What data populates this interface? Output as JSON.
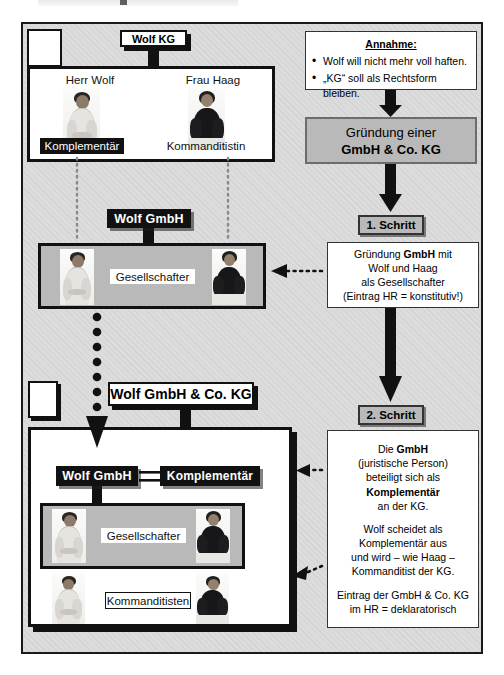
{
  "diagram": {
    "title": "Gründung einer GmbH & Co. KG",
    "corner_boxes": [
      "",
      ""
    ]
  },
  "left": {
    "kg_label": "Wolf KG",
    "person_man_name": "Herr Wolf",
    "person_woman_name": "Frau Haag",
    "man_role_initial": "Komplementär",
    "woman_role_initial": "Kommanditistin",
    "gmbh_label": "Wolf GmbH",
    "gmbh_members_caption": "Gesellschafter",
    "gmbhcokg_label": "Wolf GmbH & Co. KG",
    "inner_gmbh_label": "Wolf GmbH",
    "inner_komplementaer_label": "Komplementär",
    "inner_members_caption": "Gesellschafter",
    "kommanditisten_caption": "Kommanditisten"
  },
  "right": {
    "assumption_heading": "Annahme:",
    "assumption_items": [
      "Wolf will nicht mehr voll haften.",
      "„KG“ soll als Rechtsform bleiben."
    ],
    "goal_line1": "Gründung  einer",
    "goal_line2": "GmbH & Co. KG",
    "step1_badge": "1. Schritt",
    "step1_lines": [
      "Gründung GmbH mit",
      "Wolf und Haag",
      "als Gesellschafter",
      "(Eintrag HR = konstitutiv!)"
    ],
    "step1_bold_word": "GmbH",
    "step2_badge": "2. Schritt",
    "step2_p1": [
      "Die GmbH",
      "(juristische Person)",
      "beteiligt sich als",
      "Komplementär",
      "an der KG."
    ],
    "step2_p2": [
      "Wolf scheidet als",
      "Komplementär aus",
      "und wird – wie Haag –",
      "Kommanditist der KG."
    ],
    "step2_p3": [
      "Eintrag der GmbH & Co. KG",
      "im HR = deklaratorisch"
    ]
  },
  "colors": {
    "ink": "#111111",
    "paper": "#ffffff",
    "page_fill": "#dcdcdc",
    "accent_grey": "#b9b9b9"
  }
}
